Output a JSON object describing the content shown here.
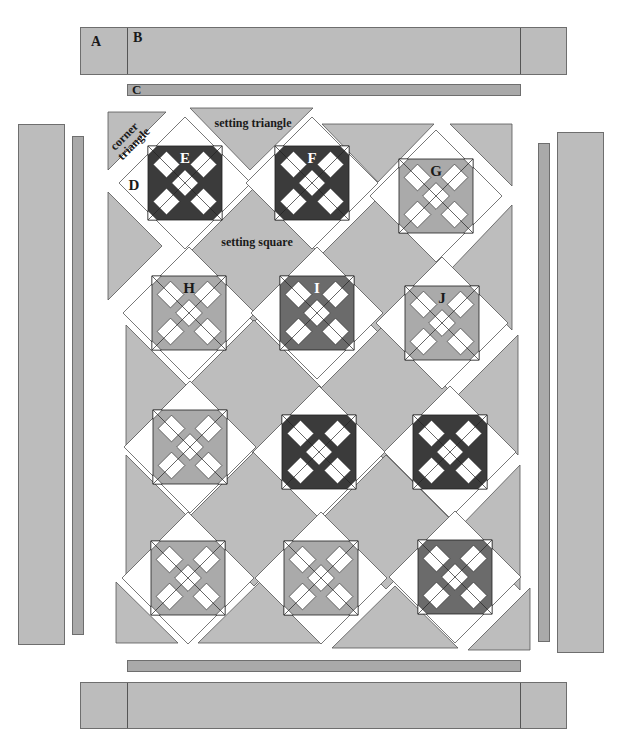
{
  "colors": {
    "background_fabric": "#bdbdbd",
    "narrow_border": "#a9a9a9",
    "dark": "#3b3b3b",
    "medium_dark": "#6b6b6b",
    "medium": "#aaaaaa",
    "white": "#ffffff",
    "outline": "#555555"
  },
  "labels": {
    "A": "A",
    "B": "B",
    "C": "C",
    "D": "D",
    "corner_triangle": [
      "corner",
      "triangle"
    ],
    "setting_triangle": "setting triangle",
    "setting_square": "setting square"
  },
  "borders": {
    "top_outer": {
      "x": 80,
      "y": 27,
      "w": 487,
      "h": 48,
      "dividers": [
        127,
        520
      ],
      "label_A": "A",
      "label_B": "B"
    },
    "top_inner": {
      "x": 127,
      "y": 84,
      "w": 394,
      "h": 12,
      "label": "C"
    },
    "left_outer": {
      "x": 18,
      "y": 124,
      "w": 47,
      "h": 521
    },
    "left_inner": {
      "x": 72,
      "y": 136,
      "w": 12,
      "h": 499
    },
    "right_inner": {
      "x": 538,
      "y": 143,
      "w": 12,
      "h": 499
    },
    "right_outer": {
      "x": 557,
      "y": 132,
      "w": 47,
      "h": 521
    },
    "bottom_inner": {
      "x": 127,
      "y": 660,
      "w": 394,
      "h": 12
    },
    "bottom_outer": {
      "x": 80,
      "y": 682,
      "w": 487,
      "h": 47,
      "dividers": [
        127,
        520
      ]
    }
  },
  "blocks": [
    {
      "id": "E",
      "label": "E",
      "cx": 185,
      "cy": 183,
      "tone": "dark"
    },
    {
      "id": "F",
      "label": "F",
      "cx": 312,
      "cy": 183,
      "tone": "dark"
    },
    {
      "id": "G",
      "label": "G",
      "cx": 436,
      "cy": 196,
      "tone": "medium"
    },
    {
      "id": "H",
      "label": "H",
      "cx": 189,
      "cy": 313,
      "tone": "medium"
    },
    {
      "id": "I",
      "label": "I",
      "cx": 317,
      "cy": 313,
      "tone": "medium_dark"
    },
    {
      "id": "J",
      "label": "J",
      "cx": 442,
      "cy": 323,
      "tone": "medium"
    },
    {
      "id": "K",
      "label": "",
      "cx": 190,
      "cy": 447,
      "tone": "medium"
    },
    {
      "id": "L",
      "label": "",
      "cx": 319,
      "cy": 452,
      "tone": "dark"
    },
    {
      "id": "M",
      "label": "",
      "cx": 450,
      "cy": 452,
      "tone": "dark"
    },
    {
      "id": "N",
      "label": "",
      "cx": 188,
      "cy": 578,
      "tone": "medium"
    },
    {
      "id": "O",
      "label": "",
      "cx": 321,
      "cy": 578,
      "tone": "medium"
    },
    {
      "id": "P",
      "label": "",
      "cx": 455,
      "cy": 577,
      "tone": "medium_dark"
    }
  ],
  "setting_pieces": [
    {
      "type": "corner_triangle",
      "points": "108,112 166,112 108,170"
    },
    {
      "type": "setting_triangle",
      "points": "190,108 313,108 250,170"
    },
    {
      "type": "setting_triangle",
      "points": "322,124 434,124 378,182"
    },
    {
      "type": "setting_triangle",
      "points": "450,124 512,124 512,186"
    },
    {
      "type": "setting_triangle",
      "points": "108,192 108,300 162,246"
    },
    {
      "type": "setting_square",
      "points": "254,188 321,255 254,322 187,255"
    },
    {
      "type": "setting_square",
      "points": "378,198 445,265 378,332 311,265"
    },
    {
      "type": "setting_triangle",
      "points": "512,205 512,330 452,268"
    },
    {
      "type": "setting_triangle",
      "points": "126,325 126,445 186,385"
    },
    {
      "type": "setting_square",
      "points": "254,320 321,387 254,454 187,387"
    },
    {
      "type": "setting_square",
      "points": "384,325 451,392 384,459 317,392"
    },
    {
      "type": "setting_triangle",
      "points": "518,335 518,455 458,395"
    },
    {
      "type": "setting_triangle",
      "points": "126,455 126,575 186,515"
    },
    {
      "type": "setting_square",
      "points": "254,452 321,519 254,586 187,519"
    },
    {
      "type": "setting_square",
      "points": "386,455 453,522 386,589 319,522"
    },
    {
      "type": "setting_triangle",
      "points": "520,465 520,590 460,527"
    },
    {
      "type": "setting_triangle",
      "points": "116,582 116,643 178,643"
    },
    {
      "type": "setting_triangle",
      "points": "198,643 322,643 260,582"
    },
    {
      "type": "setting_triangle",
      "points": "332,648 458,648 395,586"
    },
    {
      "type": "setting_triangle",
      "points": "468,650 530,650 530,588"
    }
  ],
  "text_positions": {
    "corner_triangle": {
      "x": 128,
      "y": 138,
      "rotate": -45
    },
    "setting_triangle": {
      "x": 253,
      "y": 127
    },
    "setting_square": {
      "x": 257,
      "y": 246
    },
    "D": {
      "x": 134,
      "y": 190
    }
  }
}
